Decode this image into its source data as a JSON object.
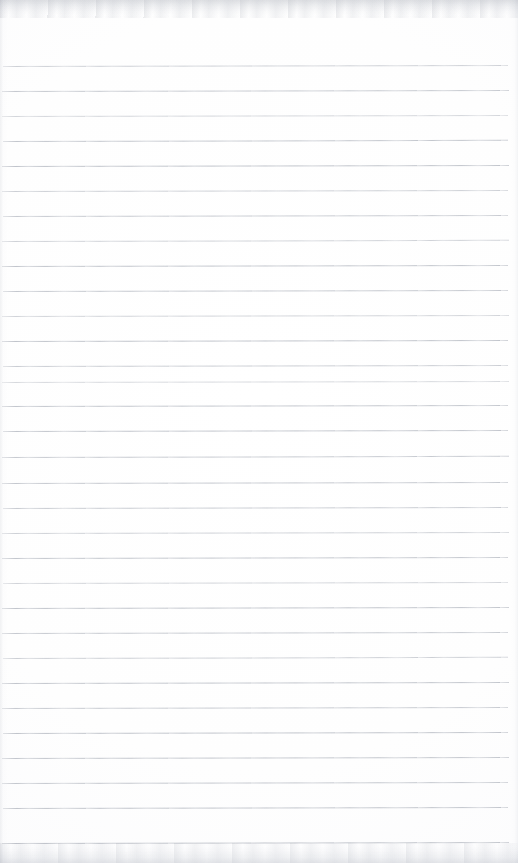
{
  "document": {
    "kind": "scanned-blank-ruled-paper",
    "page_width": 518,
    "page_height": 863,
    "paper_color": "#ffffff",
    "rule_color": "#b9bdc5",
    "text_content": "",
    "handwriting_present": "none",
    "margin_line_present": "none",
    "visible_text_items": []
  },
  "ruling": {
    "line_count": 32,
    "first_line_y": 66,
    "spacing": 25,
    "line_start_x": 2,
    "line_end_x": 509,
    "lines": [
      {
        "y": 66,
        "x": 3,
        "width": 505,
        "opacity": 0.7,
        "tilt": -0.1,
        "thickness": 1
      },
      {
        "y": 91,
        "x": 2,
        "width": 507,
        "opacity": 0.82,
        "tilt": -0.12,
        "thickness": 1
      },
      {
        "y": 116,
        "x": 2,
        "width": 506,
        "opacity": 0.62,
        "tilt": -0.1,
        "thickness": 1
      },
      {
        "y": 141,
        "x": 3,
        "width": 505,
        "opacity": 0.86,
        "tilt": -0.14,
        "thickness": 1
      },
      {
        "y": 166,
        "x": 2,
        "width": 507,
        "opacity": 0.9,
        "tilt": -0.1,
        "thickness": 1
      },
      {
        "y": 191,
        "x": 2,
        "width": 506,
        "opacity": 0.72,
        "tilt": -0.12,
        "thickness": 1
      },
      {
        "y": 216,
        "x": 3,
        "width": 505,
        "opacity": 0.8,
        "tilt": -0.1,
        "thickness": 1
      },
      {
        "y": 241,
        "x": 2,
        "width": 507,
        "opacity": 0.68,
        "tilt": -0.13,
        "thickness": 1
      },
      {
        "y": 266,
        "x": 2,
        "width": 506,
        "opacity": 0.88,
        "tilt": -0.1,
        "thickness": 1
      },
      {
        "y": 291,
        "x": 3,
        "width": 505,
        "opacity": 0.84,
        "tilt": -0.11,
        "thickness": 1
      },
      {
        "y": 316,
        "x": 2,
        "width": 507,
        "opacity": 0.66,
        "tilt": -0.1,
        "thickness": 1
      },
      {
        "y": 341,
        "x": 2,
        "width": 506,
        "opacity": 0.9,
        "tilt": -0.12,
        "thickness": 1
      },
      {
        "y": 366,
        "x": 3,
        "width": 505,
        "opacity": 0.76,
        "tilt": -0.1,
        "thickness": 1
      },
      {
        "y": 382,
        "x": 2,
        "width": 507,
        "opacity": 0.58,
        "tilt": -0.1,
        "thickness": 1
      },
      {
        "y": 406,
        "x": 2,
        "width": 506,
        "opacity": 0.86,
        "tilt": -0.12,
        "thickness": 1
      },
      {
        "y": 431,
        "x": 3,
        "width": 505,
        "opacity": 0.88,
        "tilt": -0.1,
        "thickness": 1
      },
      {
        "y": 457,
        "x": 2,
        "width": 507,
        "opacity": 0.8,
        "tilt": -0.13,
        "thickness": 1
      },
      {
        "y": 483,
        "x": 2,
        "width": 506,
        "opacity": 0.84,
        "tilt": -0.1,
        "thickness": 1
      },
      {
        "y": 508,
        "x": 3,
        "width": 505,
        "opacity": 0.78,
        "tilt": -0.11,
        "thickness": 1
      },
      {
        "y": 533,
        "x": 2,
        "width": 507,
        "opacity": 0.7,
        "tilt": -0.1,
        "thickness": 1
      },
      {
        "y": 558,
        "x": 2,
        "width": 506,
        "opacity": 0.86,
        "tilt": -0.12,
        "thickness": 1
      },
      {
        "y": 583,
        "x": 3,
        "width": 505,
        "opacity": 0.66,
        "tilt": -0.1,
        "thickness": 1
      },
      {
        "y": 608,
        "x": 2,
        "width": 507,
        "opacity": 0.88,
        "tilt": -0.11,
        "thickness": 1
      },
      {
        "y": 633,
        "x": 2,
        "width": 506,
        "opacity": 0.82,
        "tilt": -0.1,
        "thickness": 1
      },
      {
        "y": 658,
        "x": 3,
        "width": 505,
        "opacity": 0.72,
        "tilt": -0.13,
        "thickness": 1
      },
      {
        "y": 683,
        "x": 2,
        "width": 507,
        "opacity": 0.88,
        "tilt": -0.1,
        "thickness": 1
      },
      {
        "y": 708,
        "x": 2,
        "width": 506,
        "opacity": 0.8,
        "tilt": -0.12,
        "thickness": 1
      },
      {
        "y": 733,
        "x": 3,
        "width": 505,
        "opacity": 0.9,
        "tilt": -0.1,
        "thickness": 1
      },
      {
        "y": 758,
        "x": 2,
        "width": 507,
        "opacity": 0.86,
        "tilt": -0.11,
        "thickness": 1
      },
      {
        "y": 783,
        "x": 2,
        "width": 506,
        "opacity": 0.84,
        "tilt": -0.1,
        "thickness": 1
      },
      {
        "y": 808,
        "x": 3,
        "width": 505,
        "opacity": 0.88,
        "tilt": -0.12,
        "thickness": 1
      },
      {
        "y": 843,
        "x": 2,
        "width": 507,
        "opacity": 0.86,
        "tilt": -0.1,
        "thickness": 1
      }
    ]
  },
  "scan_artifacts": {
    "top_band": {
      "height": 18,
      "tone": "#c4c7cd"
    },
    "bottom_band": {
      "height": 20,
      "tone": "#cdd0d6"
    },
    "left_vignette": {
      "width": 7,
      "tone": "#e1e3e7"
    },
    "right_vignette": {
      "width": 7,
      "tone": "#e4e6ea"
    }
  }
}
